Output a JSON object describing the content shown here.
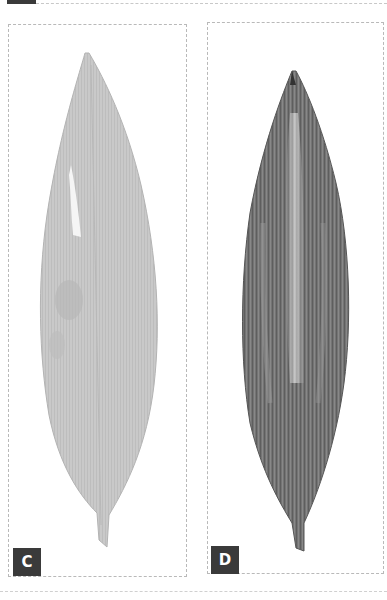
{
  "figure": {
    "panels": [
      {
        "id": "C",
        "label": "C",
        "subject": "leaf",
        "fill_color": "#c9c9c9",
        "shade_color": "#b8b8b8",
        "highlight_color": "#f4f4f4"
      },
      {
        "id": "D",
        "label": "D",
        "subject": "leaf",
        "fill_color": "#7a7a7a",
        "shade_color": "#555555",
        "highlight_color": "#c8c8c8"
      }
    ],
    "label_bg_color": "#3a3a3a",
    "label_text_color": "#ffffff",
    "border_color": "#b9b9b9"
  }
}
